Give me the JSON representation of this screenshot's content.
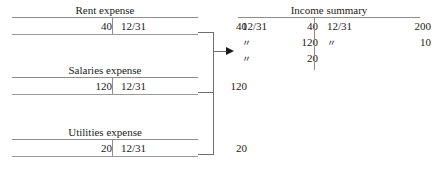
{
  "diagram": {
    "title_hidden": "Closing entries: expense accounts closed to Income summary",
    "line_color": "#8d8d8d",
    "arrow_color": "#1a1a1a",
    "background": "#ffffff",
    "ditto_mark": "〃"
  },
  "expense_accounts": [
    {
      "name": "rent-expense",
      "title": "Rent expense",
      "debit_amount": "40",
      "credit_date": "12/31",
      "credit_amount": "40"
    },
    {
      "name": "salaries-expense",
      "title": "Salaries expense",
      "debit_amount": "120",
      "credit_date": "12/31",
      "credit_amount": "120"
    },
    {
      "name": "utilities-expense",
      "title": "Utilities expense",
      "debit_amount": "20",
      "credit_date": "12/31",
      "credit_amount": "20"
    }
  ],
  "income_summary": {
    "title": "Income summary",
    "debit_rows": [
      {
        "date": "12/31",
        "amount": "40"
      },
      {
        "date": "〃",
        "amount": "120"
      },
      {
        "date": "〃",
        "amount": "20"
      }
    ],
    "credit_rows": [
      {
        "date": "12/31",
        "amount": "200"
      },
      {
        "date": "〃",
        "amount": "10"
      }
    ]
  }
}
